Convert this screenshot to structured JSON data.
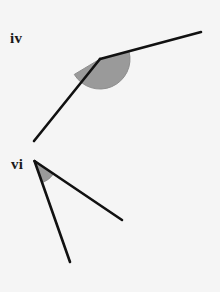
{
  "figure": {
    "width": 220,
    "height": 292,
    "background_color": "#f5f5f5",
    "stroke_color": "#111111",
    "arc_fill_color": "#9a9a9a",
    "arc_stroke_color": "#8e8e8e",
    "label_color": "#1a1a1a"
  },
  "angles": [
    {
      "id": "iv",
      "label": "iv",
      "label_position": {
        "x": 10,
        "y": 31
      },
      "vertex": {
        "x": 100,
        "y": 59
      },
      "rays": [
        {
          "name": "ray-upper-right",
          "end": {
            "x": 201,
            "y": 32
          }
        },
        {
          "name": "ray-lower-left",
          "end": {
            "x": 34,
            "y": 141
          }
        }
      ],
      "arc": {
        "radius": 30,
        "start_angle_deg": -15,
        "end_angle_deg": 149,
        "sweep": "clockwise-through-bottom"
      },
      "line_width": 2.6
    },
    {
      "id": "vi",
      "label": "vi",
      "label_position": {
        "x": 11,
        "y": 157
      },
      "vertex": {
        "x": 34.5,
        "y": 161
      },
      "rays": [
        {
          "name": "ray-lower-right",
          "end": {
            "x": 122,
            "y": 220
          }
        },
        {
          "name": "ray-lower-steep",
          "end": {
            "x": 70,
            "y": 262
          }
        }
      ],
      "arc": {
        "radius": 23,
        "start_angle_deg": 34,
        "end_angle_deg": 71,
        "sweep": "clockwise"
      },
      "line_width": 2.6
    }
  ]
}
